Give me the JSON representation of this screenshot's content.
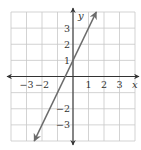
{
  "chart_data": {
    "type": "line",
    "title": "",
    "xlabel": "x",
    "ylabel": "y",
    "xlim": [
      -4,
      4
    ],
    "ylim": [
      -4,
      4
    ],
    "grid": true,
    "x_ticks": [
      "−3",
      "−2",
      "1",
      "2",
      "3"
    ],
    "x_tick_values": [
      -3,
      -2,
      1,
      2,
      3
    ],
    "y_ticks": [
      "3",
      "2",
      "1",
      "−2",
      "−3"
    ],
    "y_tick_values": [
      3,
      2,
      1,
      -2,
      -3
    ],
    "series": [
      {
        "name": "y = 2x + 1",
        "equation": "y = 2x + 1",
        "slope": 2,
        "intercept": 1,
        "x": [
          -2.5,
          -0.5,
          0,
          1.5
        ],
        "y": [
          -4,
          0,
          1,
          4
        ],
        "arrows_both_ends": true
      }
    ]
  },
  "colors": {
    "grid": "#c8c8c8",
    "axis": "#333333",
    "line": "#6b6b6b"
  }
}
